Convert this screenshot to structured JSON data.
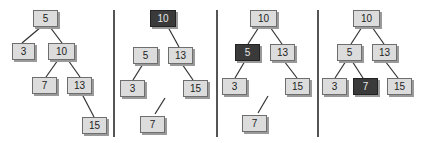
{
  "colors": {
    "node_fill": "#dcdcdc",
    "node_border": "#6e6e6e",
    "highlight_fill": "#3a3a3a",
    "edge": "#333333",
    "divider": "#555555"
  },
  "dividers": [
    113,
    216,
    317
  ],
  "panels": [
    {
      "id": "p1",
      "nodes": [
        {
          "key": "5",
          "label": "5",
          "x": 33,
          "y": 10,
          "w": 25,
          "hl": false
        },
        {
          "key": "3",
          "label": "3",
          "x": 12,
          "y": 43,
          "w": 23,
          "hl": false
        },
        {
          "key": "10",
          "label": "10",
          "x": 48,
          "y": 43,
          "w": 27,
          "hl": false
        },
        {
          "key": "7",
          "label": "7",
          "x": 32,
          "y": 77,
          "w": 25,
          "hl": false
        },
        {
          "key": "13",
          "label": "13",
          "x": 67,
          "y": 77,
          "w": 25,
          "hl": false
        },
        {
          "key": "15",
          "label": "15",
          "x": 82,
          "y": 117,
          "w": 25,
          "hl": false
        }
      ],
      "edges": [
        [
          41,
          27,
          22,
          43
        ],
        [
          50,
          27,
          62,
          43
        ],
        [
          58,
          60,
          46,
          77
        ],
        [
          68,
          60,
          80,
          77
        ],
        [
          82,
          94,
          94,
          117
        ]
      ]
    },
    {
      "id": "p2",
      "nodes": [
        {
          "key": "10",
          "label": "10",
          "x": 150,
          "y": 10,
          "w": 26,
          "hl": true
        },
        {
          "key": "5",
          "label": "5",
          "x": 133,
          "y": 47,
          "w": 25,
          "hl": false
        },
        {
          "key": "13",
          "label": "13",
          "x": 168,
          "y": 47,
          "w": 25,
          "hl": false
        },
        {
          "key": "3",
          "label": "3",
          "x": 120,
          "y": 80,
          "w": 25,
          "hl": false
        },
        {
          "key": "15",
          "label": "15",
          "x": 183,
          "y": 80,
          "w": 25,
          "hl": false
        },
        {
          "key": "7",
          "label": "7",
          "x": 140,
          "y": 116,
          "w": 25,
          "hl": false
        }
      ],
      "edges": [
        [
          168,
          27,
          179,
          47
        ],
        [
          143,
          64,
          133,
          80
        ],
        [
          182,
          64,
          193,
          80
        ],
        [
          165,
          98,
          155,
          114
        ]
      ]
    },
    {
      "id": "p3",
      "nodes": [
        {
          "key": "10",
          "label": "10",
          "x": 250,
          "y": 10,
          "w": 27,
          "hl": false
        },
        {
          "key": "5",
          "label": "5",
          "x": 235,
          "y": 44,
          "w": 25,
          "hl": true
        },
        {
          "key": "13",
          "label": "13",
          "x": 270,
          "y": 44,
          "w": 25,
          "hl": false
        },
        {
          "key": "3",
          "label": "3",
          "x": 222,
          "y": 78,
          "w": 25,
          "hl": false
        },
        {
          "key": "15",
          "label": "15",
          "x": 285,
          "y": 78,
          "w": 25,
          "hl": false
        },
        {
          "key": "7",
          "label": "7",
          "x": 242,
          "y": 115,
          "w": 25,
          "hl": false
        }
      ],
      "edges": [
        [
          259,
          27,
          248,
          44
        ],
        [
          270,
          27,
          282,
          44
        ],
        [
          245,
          61,
          235,
          78
        ],
        [
          284,
          61,
          297,
          78
        ],
        [
          268,
          96,
          258,
          113
        ]
      ]
    },
    {
      "id": "p4",
      "nodes": [
        {
          "key": "10",
          "label": "10",
          "x": 353,
          "y": 10,
          "w": 27,
          "hl": false
        },
        {
          "key": "5",
          "label": "5",
          "x": 337,
          "y": 44,
          "w": 25,
          "hl": false
        },
        {
          "key": "13",
          "label": "13",
          "x": 372,
          "y": 44,
          "w": 25,
          "hl": false
        },
        {
          "key": "3",
          "label": "3",
          "x": 322,
          "y": 78,
          "w": 25,
          "hl": false
        },
        {
          "key": "7",
          "label": "7",
          "x": 353,
          "y": 78,
          "w": 25,
          "hl": true
        },
        {
          "key": "15",
          "label": "15",
          "x": 387,
          "y": 78,
          "w": 25,
          "hl": false
        }
      ],
      "edges": [
        [
          362,
          27,
          351,
          44
        ],
        [
          372,
          27,
          384,
          44
        ],
        [
          346,
          61,
          335,
          78
        ],
        [
          352,
          61,
          363,
          78
        ],
        [
          385,
          61,
          398,
          78
        ]
      ]
    }
  ]
}
